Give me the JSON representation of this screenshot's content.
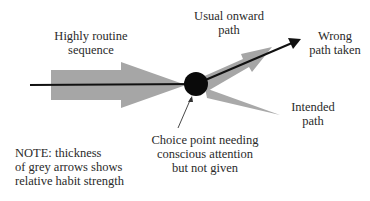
{
  "diagram": {
    "labels": {
      "routine": [
        "Highly routine",
        "sequence"
      ],
      "usual": [
        "Usual onward",
        "path"
      ],
      "wrong": [
        "Wrong",
        "path taken"
      ],
      "intended": [
        "Intended",
        "path"
      ],
      "choice": [
        "Choice point needing",
        "conscious attention",
        "but not given"
      ],
      "note": [
        "NOTE: thickness",
        "of grey arrows shows",
        "relative habit strength"
      ]
    },
    "colors": {
      "grey_arrow": "#a6a6a6",
      "black_line": "#111111",
      "choice_point": "#0a0a0a",
      "text": "#2a2a2a"
    },
    "nodes": [
      {
        "id": "choice-point",
        "shape": "circle",
        "label": "Choice point needing conscious attention but not given"
      }
    ],
    "edges": [
      {
        "from": "routine-sequence",
        "to": "choice-point",
        "style": "thick grey arrow",
        "meaning": "Highly routine sequence"
      },
      {
        "from": "choice-point",
        "to": "usual-onward-path",
        "style": "medium grey arrow",
        "meaning": "Usual onward path"
      },
      {
        "from": "choice-point",
        "to": "intended-path",
        "style": "thin grey arrow",
        "meaning": "Intended path"
      },
      {
        "from": "routine-sequence",
        "to": "wrong-path-taken",
        "style": "black line arrow",
        "meaning": "Wrong path taken"
      }
    ]
  }
}
